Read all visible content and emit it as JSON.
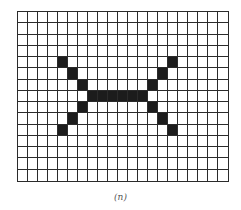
{
  "figure": {
    "caption": "(n)",
    "grid": {
      "columns": 21,
      "rows": 15,
      "line_color": "#2b2b2b",
      "fill_color": "#1c1c1c",
      "background_color": "#ffffff",
      "filled_cells": [
        [
          4,
          4
        ],
        [
          5,
          5
        ],
        [
          6,
          6
        ],
        [
          7,
          7
        ],
        [
          7,
          8
        ],
        [
          7,
          9
        ],
        [
          7,
          10
        ],
        [
          7,
          11
        ],
        [
          7,
          12
        ],
        [
          6,
          13
        ],
        [
          5,
          14
        ],
        [
          4,
          15
        ],
        [
          8,
          6
        ],
        [
          9,
          5
        ],
        [
          10,
          4
        ],
        [
          8,
          13
        ],
        [
          9,
          14
        ],
        [
          10,
          15
        ]
      ]
    }
  }
}
